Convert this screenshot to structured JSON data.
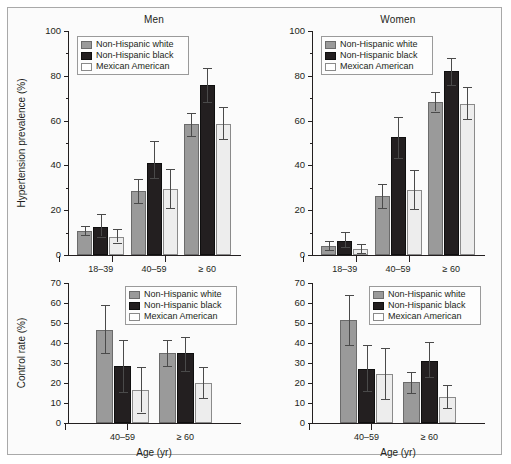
{
  "figure": {
    "background": "#fbfbfb",
    "border_color": "#a9a9a9",
    "series_colors": [
      "#9a9a9a",
      "#231f20",
      "#ededed"
    ]
  },
  "legend": {
    "entries": [
      {
        "label": "Non-Hispanic white",
        "swatch": "legend-swatch-non-hispanic-white"
      },
      {
        "label": "Non-Hispanic black",
        "swatch": "legend-swatch-non-hispanic-black"
      },
      {
        "label": "Mexican American",
        "swatch": "legend-swatch-mexican-american"
      }
    ]
  },
  "chart_data": [
    {
      "id": "men-hypertension-prevalence",
      "type": "bar",
      "title": "Men",
      "xlabel": "",
      "ylabel": "Hypertension prevalence (%)",
      "ylim": [
        0,
        100
      ],
      "yticks": [
        0,
        20,
        40,
        60,
        80,
        100
      ],
      "yticks_minor": [
        10,
        30,
        50,
        70,
        90
      ],
      "grid": false,
      "legend_position": "top-left",
      "categories": [
        "18–39",
        "40–59",
        "≥ 60"
      ],
      "series": [
        {
          "name": "Non-Hispanic white",
          "values": [
            10.6,
            28.4,
            58.6
          ],
          "err_low": [
            8.8,
            23.0,
            53.1
          ],
          "err_high": [
            12.8,
            33.9,
            63.5
          ]
        },
        {
          "name": "Non-Hispanic black",
          "values": [
            12.3,
            41.2,
            75.8
          ],
          "err_low": [
            8.2,
            34.3,
            68.3
          ],
          "err_high": [
            18.1,
            51.1,
            83.3
          ]
        },
        {
          "name": "Mexican American",
          "values": [
            8.1,
            29.3,
            58.7
          ],
          "err_low": [
            5.5,
            21.2,
            51.8
          ],
          "err_high": [
            11.5,
            38.6,
            66.0
          ]
        }
      ]
    },
    {
      "id": "women-hypertension-prevalence",
      "type": "bar",
      "title": "Women",
      "xlabel": "",
      "ylabel": "",
      "ylim": [
        0,
        100
      ],
      "yticks": [
        0,
        20,
        40,
        60,
        80,
        100
      ],
      "yticks_minor": [
        10,
        30,
        50,
        70,
        90
      ],
      "grid": false,
      "legend_position": "top-left",
      "categories": [
        "18–39",
        "40–59",
        "≥ 60"
      ],
      "series": [
        {
          "name": "Non-Hispanic white",
          "values": [
            4.0,
            26.3,
            68.2
          ],
          "err_low": [
            2.4,
            20.8,
            64.0
          ],
          "err_high": [
            6.4,
            31.5,
            72.6
          ]
        },
        {
          "name": "Non-Hispanic black",
          "values": [
            6.4,
            52.5,
            82.2
          ],
          "err_low": [
            3.4,
            43.3,
            75.9
          ],
          "err_high": [
            10.2,
            61.8,
            87.9
          ]
        },
        {
          "name": "Mexican American",
          "values": [
            2.5,
            28.8,
            67.4
          ],
          "err_low": [
            0.9,
            20.4,
            60.6
          ],
          "err_high": [
            4.8,
            38.1,
            74.8
          ]
        }
      ]
    },
    {
      "id": "men-control-rate",
      "type": "bar",
      "title": "",
      "xlabel": "Age (yr)",
      "ylabel": "Control rate (%)",
      "ylim": [
        0,
        70
      ],
      "yticks": [
        0,
        10,
        20,
        30,
        40,
        50,
        60,
        70
      ],
      "grid": false,
      "legend_position": "top-right",
      "categories": [
        "40–59",
        "≥ 60"
      ],
      "series": [
        {
          "name": "Non-Hispanic white",
          "values": [
            46.4
          ],
          "err_low": [
            34.9
          ],
          "err_high": [
            58.8
          ]
        },
        {
          "name": "Non-Hispanic black",
          "values": [
            28.4
          ],
          "err_low": [
            15.6
          ],
          "err_high": [
            41.6
          ]
        },
        {
          "name": "Mexican American",
          "values": [
            16.4
          ],
          "err_low": [
            5.2
          ],
          "err_high": [
            27.9
          ]
        }
      ],
      "series_group2": [
        {
          "name": "Non-Hispanic white",
          "values": [
            35.0
          ],
          "err_low": [
            28.4
          ],
          "err_high": [
            41.7
          ]
        },
        {
          "name": "Non-Hispanic black",
          "values": [
            34.8
          ],
          "err_low": [
            26.1
          ],
          "err_high": [
            43.2
          ]
        },
        {
          "name": "Mexican American",
          "values": [
            20.2
          ],
          "err_low": [
            12.4
          ],
          "err_high": [
            27.9
          ]
        }
      ]
    },
    {
      "id": "women-control-rate",
      "type": "bar",
      "title": "",
      "xlabel": "Age (yr)",
      "ylabel": "",
      "ylim": [
        0,
        70
      ],
      "yticks": [
        0,
        10,
        20,
        30,
        40,
        50,
        60,
        70
      ],
      "grid": false,
      "legend_position": "top-right",
      "categories": [
        "40–59",
        "≥ 60"
      ],
      "series": [
        {
          "name": "Non-Hispanic white",
          "values": [
            51.7
          ],
          "err_low": [
            39.2
          ],
          "err_high": [
            64.2
          ]
        },
        {
          "name": "Non-Hispanic black",
          "values": [
            27.2
          ],
          "err_low": [
            16.0
          ],
          "err_high": [
            38.8
          ]
        },
        {
          "name": "Mexican American",
          "values": [
            24.6
          ],
          "err_low": [
            11.9
          ],
          "err_high": [
            37.5
          ]
        }
      ],
      "series_group2": [
        {
          "name": "Non-Hispanic white",
          "values": [
            20.6
          ],
          "err_low": [
            14.8
          ],
          "err_high": [
            25.6
          ]
        },
        {
          "name": "Non-Hispanic black",
          "values": [
            31.2
          ],
          "err_low": [
            22.8
          ],
          "err_high": [
            40.3
          ]
        },
        {
          "name": "Mexican American",
          "values": [
            13.0
          ],
          "err_low": [
            7.6
          ],
          "err_high": [
            19.2
          ]
        }
      ]
    }
  ]
}
